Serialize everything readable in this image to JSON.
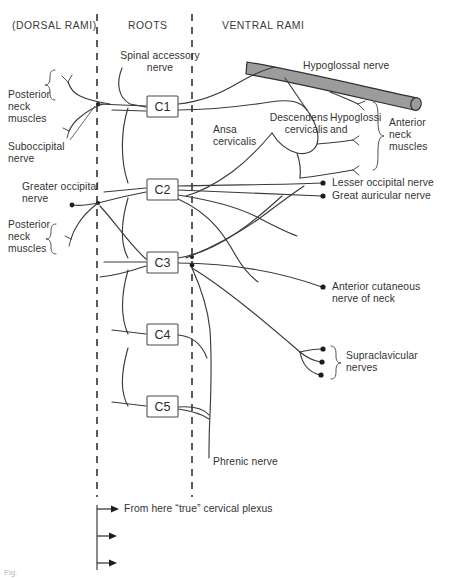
{
  "figure": {
    "caption": "Fig.",
    "background_color": "#ffffff",
    "line_color": "#3a3a3a",
    "hypoglossal_color": "#9c9c9c"
  },
  "column_headers": [
    {
      "id": "dorsal-rami",
      "label": "(DORSAL RAMI)"
    },
    {
      "id": "roots",
      "label": "ROOTS"
    },
    {
      "id": "ventral-rami",
      "label": "VENTRAL RAMI"
    }
  ],
  "roots": [
    {
      "id": "c1",
      "label": "C1"
    },
    {
      "id": "c2",
      "label": "C2"
    },
    {
      "id": "c3",
      "label": "C3"
    },
    {
      "id": "c4",
      "label": "C4"
    },
    {
      "id": "c5",
      "label": "C5"
    }
  ],
  "left_labels": [
    {
      "id": "posterior-neck-muscles-upper",
      "label": "Posterior\nneck\nmuscles"
    },
    {
      "id": "suboccipital-nerve",
      "label": "Suboccipital\nnerve"
    },
    {
      "id": "greater-occipital-nerve",
      "label": "Greater occipital\nnerve"
    },
    {
      "id": "posterior-neck-muscles-lower",
      "label": "Posterior\nneck\nmuscles"
    }
  ],
  "center_labels": [
    {
      "id": "spinal-accessory-nerve",
      "label": "Spinal accessory\nnerve"
    },
    {
      "id": "ansa-cervicalis",
      "label": "Ansa\ncervicalis"
    },
    {
      "id": "phrenic-nerve",
      "label": "Phrenic nerve"
    }
  ],
  "right_labels": [
    {
      "id": "hypoglossal-nerve",
      "label": "Hypoglossal nerve"
    },
    {
      "id": "descendens-cervicalis",
      "label": "Descendens\ncervicalis"
    },
    {
      "id": "hypoglossi-and",
      "label": "Hypoglossi\nand"
    },
    {
      "id": "anterior-neck-muscles",
      "label": "Anterior\nneck\nmuscles"
    },
    {
      "id": "lesser-occipital-nerve",
      "label": "Lesser occipital nerve"
    },
    {
      "id": "great-auricular-nerve",
      "label": "Great auricular nerve"
    },
    {
      "id": "anterior-cutaneous-nerve-of-neck",
      "label": "Anterior cutaneous\nnerve of neck"
    },
    {
      "id": "supraclavicular-nerves",
      "label": "Supraclavicular\nnerves"
    }
  ],
  "footer": {
    "note": "From here “true” cervical plexus",
    "arrow_count": 3
  }
}
